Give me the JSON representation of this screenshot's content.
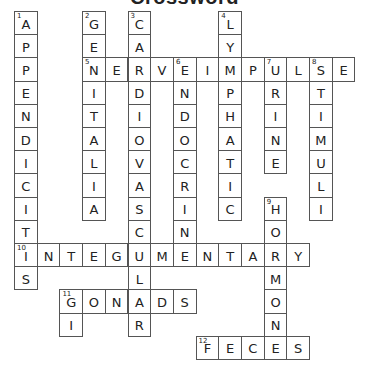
{
  "title": "Crossword",
  "grid": {
    "origin_x": 14,
    "origin_y": 11,
    "cell_w": 22.7,
    "cell_h": 23.2
  },
  "words": [
    {
      "number": 1,
      "direction": "down",
      "answer": "APPENDICITIS",
      "row": 0,
      "col": 0
    },
    {
      "number": 2,
      "direction": "down",
      "answer": "GENITALIA",
      "row": 0,
      "col": 3
    },
    {
      "number": 3,
      "direction": "down",
      "answer": "CARDIOVASCULAR",
      "row": 0,
      "col": 5
    },
    {
      "number": 4,
      "direction": "down",
      "answer": "LYMPHATIC",
      "row": 0,
      "col": 9
    },
    {
      "number": 5,
      "direction": "across",
      "answer": "NERVEIMPULSE",
      "row": 2,
      "col": 3
    },
    {
      "number": 6,
      "direction": "down",
      "answer": "ENDOCRINE",
      "row": 2,
      "col": 7
    },
    {
      "number": 7,
      "direction": "down",
      "answer": "URINE",
      "row": 2,
      "col": 11
    },
    {
      "number": 8,
      "direction": "down",
      "answer": "STIMULI",
      "row": 2,
      "col": 13
    },
    {
      "number": 9,
      "direction": "down",
      "answer": "HORMONE",
      "row": 8,
      "col": 11
    },
    {
      "number": 10,
      "direction": "across",
      "answer": "INTEGUMENTARY",
      "row": 10,
      "col": 0
    },
    {
      "number": 11,
      "direction": "across",
      "answer": "GONADS",
      "row": 12,
      "col": 2
    },
    {
      "number": 11,
      "direction": "down",
      "answer": "GI",
      "row": 12,
      "col": 2
    },
    {
      "number": 12,
      "direction": "across",
      "answer": "FECES",
      "row": 14,
      "col": 8
    }
  ]
}
